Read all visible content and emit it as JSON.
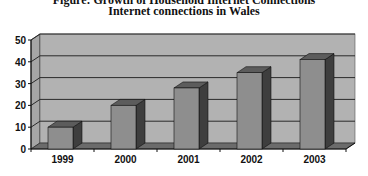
{
  "title_partial": "Figure: Growth of Household Internet Connections",
  "title": "Internet connections in Wales",
  "colors": {
    "wall": "#b2b2b2",
    "wall_side": "#a6a6a6",
    "floor": "#6b6b6b",
    "gridline": "#2a2a2a",
    "bar_front": "#8e8e8e",
    "bar_side": "#3e3e3e",
    "bar_top": "#5c5c5c"
  },
  "chart_data": {
    "type": "bar",
    "style": "3d-column",
    "title": "Internet connections in Wales",
    "xlabel": "",
    "ylabel": "",
    "categories": [
      "1999",
      "2000",
      "2001",
      "2002",
      "2003"
    ],
    "values": [
      10,
      20,
      28,
      35,
      41
    ],
    "ylim": [
      0,
      50
    ],
    "yticks": [
      0,
      10,
      20,
      30,
      40,
      50
    ],
    "grid": true,
    "legend": null
  }
}
